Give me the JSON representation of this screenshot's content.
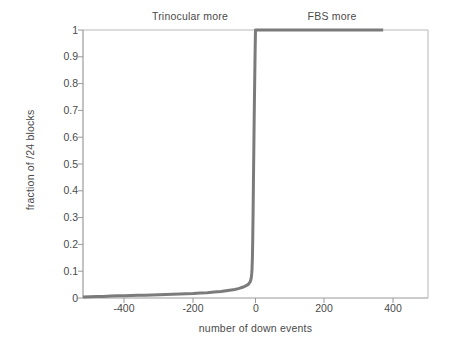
{
  "chart_data": {
    "type": "line",
    "title": "",
    "subtitle": "",
    "xlabel": "number of down events",
    "ylabel": "fraction of /24 blocks",
    "xlim": [
      -500,
      500
    ],
    "ylim": [
      0,
      1
    ],
    "xticks": [
      -400,
      -200,
      0,
      200,
      400
    ],
    "xtick_labels": [
      "-400",
      "-200",
      "0",
      "200",
      "400"
    ],
    "yticks": [
      0,
      0.1,
      0.2,
      0.3,
      0.4,
      0.5,
      0.6,
      0.7,
      0.8,
      0.9,
      1
    ],
    "ytick_labels": [
      "0",
      "0.1",
      "0.2",
      "0.3",
      "0.4",
      "0.5",
      "0.6",
      "0.7",
      "0.8",
      "0.9",
      "1"
    ],
    "grid": false,
    "legend": null,
    "legend_position": "none",
    "annotations": [
      {
        "text": "Trinocular more",
        "x": -320,
        "y": 1.06
      },
      {
        "text": "FBS more",
        "x": 140,
        "y": 1.06
      }
    ],
    "series": [
      {
        "name": "cumulative fraction of /24 blocks",
        "color": "#7b7b7b",
        "line_width": 3,
        "points": [
          [
            -500,
            0.004
          ],
          [
            -480,
            0.005
          ],
          [
            -460,
            0.006
          ],
          [
            -440,
            0.006
          ],
          [
            -420,
            0.007
          ],
          [
            -400,
            0.008
          ],
          [
            -380,
            0.008
          ],
          [
            -360,
            0.009
          ],
          [
            -340,
            0.01
          ],
          [
            -320,
            0.01
          ],
          [
            -300,
            0.011
          ],
          [
            -280,
            0.012
          ],
          [
            -260,
            0.013
          ],
          [
            -240,
            0.014
          ],
          [
            -220,
            0.015
          ],
          [
            -200,
            0.016
          ],
          [
            -180,
            0.017
          ],
          [
            -160,
            0.019
          ],
          [
            -140,
            0.02
          ],
          [
            -120,
            0.022
          ],
          [
            -100,
            0.024
          ],
          [
            -90,
            0.026
          ],
          [
            -80,
            0.028
          ],
          [
            -70,
            0.03
          ],
          [
            -60,
            0.032
          ],
          [
            -50,
            0.035
          ],
          [
            -45,
            0.037
          ],
          [
            -40,
            0.039
          ],
          [
            -35,
            0.041
          ],
          [
            -30,
            0.044
          ],
          [
            -26,
            0.047
          ],
          [
            -22,
            0.05
          ],
          [
            -19,
            0.054
          ],
          [
            -16,
            0.059
          ],
          [
            -14,
            0.066
          ],
          [
            -12,
            0.078
          ],
          [
            -11,
            0.09
          ],
          [
            -10,
            0.11
          ],
          [
            -9,
            0.15
          ],
          [
            -8,
            0.22
          ],
          [
            -7,
            0.32
          ],
          [
            -6,
            0.43
          ],
          [
            -5,
            0.54
          ],
          [
            -4,
            0.65
          ],
          [
            -3,
            0.75
          ],
          [
            -2,
            0.84
          ],
          [
            -1,
            0.93
          ],
          [
            0,
            1.0
          ],
          [
            40,
            1.0
          ],
          [
            100,
            1.0
          ],
          [
            200,
            1.0
          ],
          [
            300,
            1.0
          ],
          [
            370,
            1.0
          ]
        ]
      }
    ]
  },
  "axes": {
    "spine_color": "#9a9a9a",
    "tick_color": "#9a9a9a",
    "background": "#ffffff"
  }
}
